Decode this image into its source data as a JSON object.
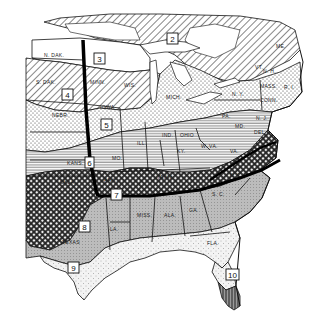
{
  "map": {
    "type": "zone-map",
    "style": "black-and-white hatched regions",
    "region_shown": "Eastern and central United States",
    "zones": [
      {
        "number": "2",
        "pattern": "diagonal-hatch",
        "location": "northern Great Lakes / Canada border"
      },
      {
        "number": "3",
        "pattern": "white",
        "location": "northern Minnesota"
      },
      {
        "number": "4",
        "pattern": "diagonal-hatch",
        "location": "S. Dakota / Minnesota / Wisconsin"
      },
      {
        "number": "5",
        "pattern": "dotted",
        "location": "Iowa / Nebraska / Michigan / N.Y."
      },
      {
        "number": "6",
        "pattern": "horizontal-lines",
        "location": "Kansas / Missouri / Illinois / Ohio"
      },
      {
        "number": "7",
        "pattern": "crosshatch",
        "location": "Arkansas / Tennessee / Virginia"
      },
      {
        "number": "8",
        "pattern": "fine-stipple-gray",
        "location": "Texas / Mississippi / Alabama / Georgia"
      },
      {
        "number": "9",
        "pattern": "light-dots",
        "location": "Gulf coast Texas / Florida"
      },
      {
        "number": "10",
        "pattern": "vertical-lines",
        "location": "southern Florida"
      }
    ],
    "zone_labels": [
      {
        "id": "2",
        "text": "2"
      },
      {
        "id": "3",
        "text": "3"
      },
      {
        "id": "4",
        "text": "4"
      },
      {
        "id": "5",
        "text": "5"
      },
      {
        "id": "6",
        "text": "6"
      },
      {
        "id": "7",
        "text": "7"
      },
      {
        "id": "8",
        "text": "8"
      },
      {
        "id": "9",
        "text": "9"
      },
      {
        "id": "10",
        "text": "10"
      }
    ],
    "state_labels": {
      "ndak": "N. DAK.",
      "sdak": "S. DAK.",
      "minn": "MINN.",
      "wis": "WIS.",
      "iowa": "IOWA",
      "nebr": "NEBR.",
      "mich": "MICH.",
      "ill": "ILL.",
      "ind": "IND.",
      "ohio": "OHIO",
      "kans": "KANS.",
      "mo": "MO.",
      "okla": "OKLA.",
      "ark": "ARK.",
      "ky": "KY.",
      "wva": "W. VA.",
      "va": "VA.",
      "tenn": "TENN.",
      "nc": "N. C.",
      "sc": "S. C.",
      "ga": "GA.",
      "ala": "ALA.",
      "miss": "MISS.",
      "la": "LA.",
      "texas": "TEXAS",
      "fla": "FLA.",
      "pa": "PA.",
      "ny": "N. Y.",
      "nj": "N. J.",
      "md": "MD.",
      "del": "DEL.",
      "conn": "CONN.",
      "mass": "MASS.",
      "ri": "R. I.",
      "nh": "N. H.",
      "vt": "VT.",
      "me": "ME."
    }
  }
}
